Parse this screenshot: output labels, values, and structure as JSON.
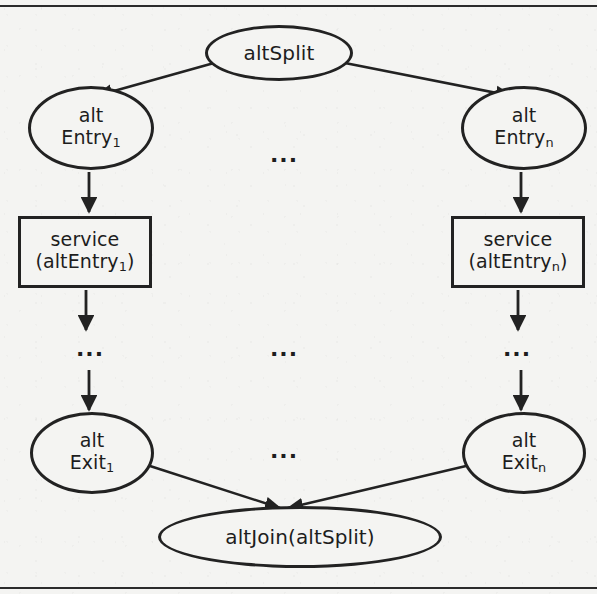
{
  "figure": {
    "background_color": "#f4f4f2",
    "stroke_color": "#222222",
    "has_top_rule": true,
    "has_bottom_rule": true
  },
  "nodes": {
    "alt_split": {
      "label": "altSplit",
      "shape": "ellipse"
    },
    "alt_entry_1": {
      "line1": "alt",
      "line2_prefix": "Entry",
      "line2_sub": "1",
      "shape": "ellipse"
    },
    "alt_entry_n": {
      "line1": "alt",
      "line2_prefix": "Entry",
      "line2_sub": "n",
      "shape": "ellipse"
    },
    "service_1": {
      "line1": "service",
      "line2_prefix": "(altEntry",
      "line2_sub": "1",
      "line2_suffix": ")",
      "shape": "rectangle"
    },
    "service_n": {
      "line1": "service",
      "line2_prefix": "(altEntry",
      "line2_sub": "n",
      "line2_suffix": ")",
      "shape": "rectangle"
    },
    "alt_exit_1": {
      "line1": "alt",
      "line2_prefix": "Exit",
      "line2_sub": "1",
      "shape": "ellipse"
    },
    "alt_exit_n": {
      "line1": "alt",
      "line2_prefix": "Exit",
      "line2_sub": "n",
      "shape": "ellipse"
    },
    "alt_join": {
      "label": "altJoin(altSplit)",
      "shape": "ellipse"
    }
  },
  "ellipses_markers": {
    "top_middle": "...",
    "middle_left": "...",
    "middle_center": "...",
    "middle_right": "...",
    "exit_middle": "..."
  },
  "edges": [
    {
      "from": "alt_split",
      "to": "alt_entry_1",
      "arrow": true
    },
    {
      "from": "alt_split",
      "to": "alt_entry_n",
      "arrow": true
    },
    {
      "from": "alt_entry_1",
      "to": "service_1",
      "arrow": true
    },
    {
      "from": "alt_entry_n",
      "to": "service_n",
      "arrow": true
    },
    {
      "from": "service_1",
      "to": "middle_left",
      "arrow": true
    },
    {
      "from": "service_n",
      "to": "middle_right",
      "arrow": true
    },
    {
      "from": "middle_left",
      "to": "alt_exit_1",
      "arrow": true
    },
    {
      "from": "middle_right",
      "to": "alt_exit_n",
      "arrow": true
    },
    {
      "from": "alt_exit_1",
      "to": "alt_join",
      "arrow": true
    },
    {
      "from": "alt_exit_n",
      "to": "alt_join",
      "arrow": true
    }
  ]
}
